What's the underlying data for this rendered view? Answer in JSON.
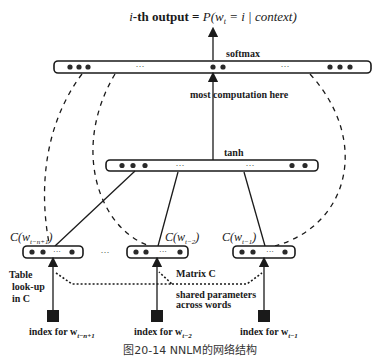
{
  "diagram": {
    "output_label": {
      "prefix": "i",
      "middle": "-th output = ",
      "formula": "P(w",
      "sub": "t",
      "rest": " = i | context)"
    },
    "softmax_label": "softmax",
    "computation_label": "most computation here",
    "tanh_label": "tanh",
    "embeddings": [
      {
        "label_main": "C(w",
        "label_sub": "t−n+1",
        "label_close": ")"
      },
      {
        "label_main": "C(w",
        "label_sub": "t−2",
        "label_close": ")"
      },
      {
        "label_main": "C(w",
        "label_sub": "t−1",
        "label_close": ")"
      }
    ],
    "between_dots": "···",
    "ellipsis": "···",
    "table_lookup": [
      "Table",
      "look-up",
      "in C"
    ],
    "matrix_label": "Matrix C",
    "shared_label": [
      "shared parameters",
      "across words"
    ],
    "indices": [
      {
        "prefix": "index for w",
        "sub": "t−n+1"
      },
      {
        "prefix": "index for w",
        "sub": "t−2"
      },
      {
        "prefix": "index for w",
        "sub": "t−1"
      }
    ],
    "caption": "图20-14    NNLM的网络结构",
    "colors": {
      "line": "#1a1a1a",
      "node": "#2a2a2a",
      "background": "#ffffff"
    }
  }
}
